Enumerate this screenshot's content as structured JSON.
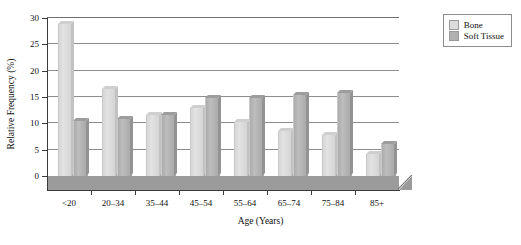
{
  "chart_data": {
    "type": "bar",
    "title": "",
    "xlabel": "Age (Years)",
    "ylabel": "Relative Frequency (%)",
    "ylim": [
      0,
      30
    ],
    "ytick_labels": [
      "0",
      "5",
      "10",
      "15",
      "20",
      "25",
      "30"
    ],
    "ytick_values": [
      0,
      5,
      10,
      15,
      20,
      25,
      30
    ],
    "grid": true,
    "legend_position": "top-right",
    "categories": [
      "<20",
      "20–34",
      "35–44",
      "45–54",
      "55–64",
      "65–74",
      "75–84",
      "85+"
    ],
    "series": [
      {
        "name": "Bone",
        "color": "#dcdcdc",
        "values": [
          28.8,
          16.5,
          11.5,
          12.9,
          10.2,
          8.6,
          7.8,
          4.2
        ]
      },
      {
        "name": "Soft Tissue",
        "color": "#b0b0b0",
        "values": [
          10.5,
          10.8,
          11.5,
          14.9,
          14.9,
          15.3,
          15.7,
          6.1
        ]
      }
    ]
  },
  "legend": {
    "items": [
      {
        "label": "Bone",
        "swatch_class": "bone"
      },
      {
        "label": "Soft Tissue",
        "swatch_class": "soft"
      }
    ]
  }
}
